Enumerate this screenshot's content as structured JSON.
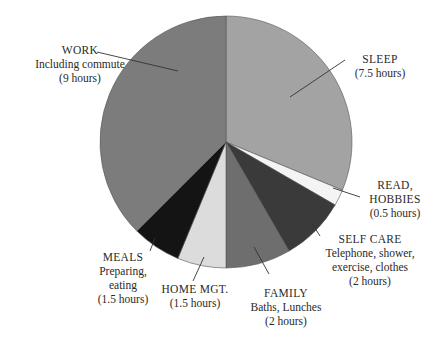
{
  "chart_data": {
    "type": "pie",
    "title": "",
    "unit": "hours",
    "total": 24,
    "start_angle_deg": 0,
    "direction": "clockwise",
    "slices": [
      {
        "name": "SLEEP",
        "detail": "",
        "value": 7.5,
        "value_label": "(7.5 hours)",
        "color": "#a3a3a3"
      },
      {
        "name": "READ, HOBBIES",
        "detail": "",
        "value": 0.5,
        "value_label": "(0.5 hours)",
        "color": "#f4f4f4"
      },
      {
        "name": "SELF CARE",
        "detail": "Telephone, shower, exercise, clothes",
        "value": 2,
        "value_label": "(2 hours)",
        "color": "#3a3a3a"
      },
      {
        "name": "FAMILY",
        "detail": "Baths, Lunches",
        "value": 2,
        "value_label": "(2 hours)",
        "color": "#6e6e6e"
      },
      {
        "name": "HOME MGT.",
        "detail": "",
        "value": 1.5,
        "value_label": "(1.5 hours)",
        "color": "#dcdcdc"
      },
      {
        "name": "MEALS",
        "detail": "Preparing, eating",
        "value": 1.5,
        "value_label": "(1.5 hours)",
        "color": "#141414"
      },
      {
        "name": "WORK",
        "detail": "Including commute",
        "value": 9,
        "value_label": "(9 hours)",
        "color": "#7c7c7c"
      }
    ]
  },
  "labels": {
    "work": {
      "l1": "WORK",
      "l2": "Including commute",
      "l3": "(9 hours)"
    },
    "sleep": {
      "l1": "SLEEP",
      "l2": "(7.5 hours)"
    },
    "read": {
      "l1": "READ,",
      "l2": "HOBBIES",
      "l3": "(0.5 hours)"
    },
    "selfcare": {
      "l1": "SELF CARE",
      "l2": "Telephone, shower,",
      "l3": "exercise, clothes",
      "l4": "(2 hours)"
    },
    "family": {
      "l1": "FAMILY",
      "l2": "Baths, Lunches",
      "l3": "(2 hours)"
    },
    "homemgt": {
      "l1": "HOME MGT.",
      "l2": "(1.5 hours)"
    },
    "meals": {
      "l1": "MEALS",
      "l2": "Preparing,",
      "l3": "eating",
      "l4": "(1.5 hours)"
    }
  }
}
